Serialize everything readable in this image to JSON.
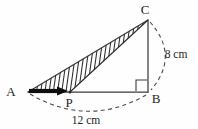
{
  "figure": {
    "background_color": "#fefefe",
    "stroke_color": "#3a3a3c",
    "hatch_color": "#2c2c2e",
    "arrow_color": "#0d0d0d"
  },
  "vertices": {
    "A": {
      "label": "A",
      "x": 28,
      "y": 92,
      "label_x": 11,
      "label_y": 96
    },
    "B": {
      "label": "B",
      "x": 148,
      "y": 92,
      "label_x": 154,
      "label_y": 103
    },
    "C": {
      "label": "C",
      "x": 148,
      "y": 20,
      "label_x": 143,
      "label_y": 14
    },
    "P": {
      "label": "P",
      "x": 70,
      "y": 92,
      "label_x": 66,
      "label_y": 105
    }
  },
  "dimensions": [
    {
      "name": "base",
      "label": "12 cm",
      "value": 12,
      "unit": "cm",
      "label_x": 72,
      "label_y": 124,
      "between": "A-B"
    },
    {
      "name": "height",
      "label": "8 cm",
      "value": 8,
      "unit": "cm",
      "label_x": 163,
      "label_y": 58,
      "between": "C-B"
    }
  ],
  "markers": {
    "right_angle": {
      "name": "right-angle-at-B",
      "x": 136,
      "y": 80,
      "size": 11,
      "at_vertex": "B"
    }
  },
  "arrow": {
    "name": "direction-arrow",
    "from_x": 29,
    "from_y": 91,
    "to_x": 68,
    "to_y": 91,
    "head_length": 11,
    "head_width": 9
  },
  "hatching": {
    "region": "A-P-C",
    "line_count": 27,
    "angle_deg": 82,
    "spacing_px": 4.2
  },
  "arcs": [
    {
      "name": "base-arc",
      "from": "A",
      "to": "B",
      "bulge": "down",
      "sag_px": 26
    },
    {
      "name": "height-arc",
      "from": "C",
      "to": "B",
      "bulge": "right",
      "sag_px": 28
    }
  ]
}
